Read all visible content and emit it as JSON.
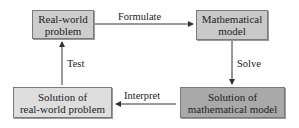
{
  "diagram": {
    "nodes": [
      {
        "id": "real-world-problem",
        "label_line1": "Real-world",
        "label_line2": "problem",
        "fill": "#cdcdcd"
      },
      {
        "id": "mathematical-model",
        "label_line1": "Mathematical",
        "label_line2": "model",
        "fill": "#c9c9c9"
      },
      {
        "id": "solution-real-world",
        "label_line1": "Solution of",
        "label_line2": "real-world problem",
        "fill": "#dedede"
      },
      {
        "id": "solution-math-model",
        "label_line1": "Solution of",
        "label_line2": "mathematical model",
        "fill": "#a9a9a9"
      }
    ],
    "edges": [
      {
        "from": "real-world-problem",
        "to": "mathematical-model",
        "label": "Formulate"
      },
      {
        "from": "mathematical-model",
        "to": "solution-math-model",
        "label": "Solve"
      },
      {
        "from": "solution-math-model",
        "to": "solution-real-world",
        "label": "Interpret"
      },
      {
        "from": "solution-real-world",
        "to": "real-world-problem",
        "label": "Test"
      }
    ],
    "arrow_color": "#333333"
  }
}
